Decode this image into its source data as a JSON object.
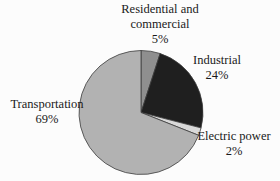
{
  "chart_data": {
    "type": "pie",
    "title": "",
    "direction": "clockwise",
    "start_angle_deg": 0,
    "stroke_color": "#3c3c3c",
    "background_color": "#fcfcfc",
    "slices": [
      {
        "label": "Residential and commercial",
        "pct_label": "5%",
        "value": 5,
        "color": "#8f8f8f"
      },
      {
        "label": "Industrial",
        "pct_label": "24%",
        "value": 24,
        "color": "#1f1f1f"
      },
      {
        "label": "Electric power",
        "pct_label": "2%",
        "value": 2,
        "color": "#d9d9d9"
      },
      {
        "label": "Transportation",
        "pct_label": "69%",
        "value": 69,
        "color": "#b2b2b2"
      }
    ]
  }
}
